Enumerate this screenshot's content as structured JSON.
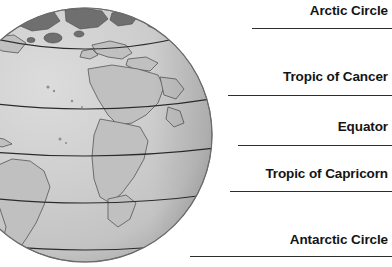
{
  "figure": {
    "background_color": "#ffffff",
    "text_color": "#141414",
    "leader_line_color": "#2e2e2e",
    "globe_ocean_color": "#c9c9c9",
    "globe_land_color": "#b9b9b9",
    "globe_polar_land_color": "#6f6f6f",
    "globe_polar_ice_color": "#d9d9d9",
    "globe_outline_color": "#6b6b6b"
  },
  "labels": [
    {
      "id": "arctic-circle",
      "text": "Arctic Circle",
      "top": 4,
      "line_y": 28,
      "line_left": 252,
      "line_right": 392
    },
    {
      "id": "tropic-of-cancer",
      "text": "Tropic of Cancer",
      "top": 70,
      "line_y": 95,
      "line_left": 228,
      "line_right": 392
    },
    {
      "id": "equator",
      "text": "Equator",
      "top": 120,
      "line_y": 145,
      "line_left": 238,
      "line_right": 392
    },
    {
      "id": "tropic-of-capricorn",
      "text": "Tropic of Capricorn",
      "top": 167,
      "line_y": 191,
      "line_left": 230,
      "line_right": 392
    },
    {
      "id": "antarctic-circle",
      "text": "Antarctic Circle",
      "top": 233,
      "line_y": 256,
      "line_left": 190,
      "line_right": 392
    }
  ],
  "globe_latitudes": [
    {
      "id": "arctic-circle-line",
      "name": "Arctic Circle"
    },
    {
      "id": "tropic-of-cancer-line",
      "name": "Tropic of Cancer"
    },
    {
      "id": "equator-line",
      "name": "Equator"
    },
    {
      "id": "tropic-of-capricorn-line",
      "name": "Tropic of Capricorn"
    },
    {
      "id": "antarctic-circle-line",
      "name": "Antarctic Circle"
    }
  ]
}
